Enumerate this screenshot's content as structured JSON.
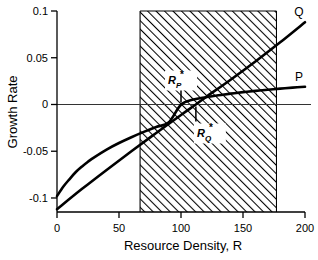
{
  "chart_data": {
    "type": "line",
    "title": "",
    "xlabel": "Resource Density, R",
    "ylabel": "Growth Rate",
    "xlim": [
      0,
      200
    ],
    "ylim": [
      -0.115,
      0.1
    ],
    "grid": false,
    "legend_position": "inline-right-of-curve-ends",
    "xticks": [
      0,
      50,
      100,
      150,
      200
    ],
    "xtick_labels": [
      "0",
      "50",
      "100",
      "150",
      "200"
    ],
    "yticks": [
      0.1,
      0.05,
      0,
      -0.05,
      -0.1
    ],
    "ytick_labels": [
      "0.1",
      "0.05",
      "0",
      "-0.05",
      "-0.1"
    ],
    "zero_reference_line": 0,
    "series": [
      {
        "name": "P",
        "label": "P",
        "style": "saturating-monod-curve",
        "x": [
          0,
          5,
          10,
          15,
          20,
          25,
          30,
          40,
          50,
          60,
          70,
          80,
          90,
          100,
          110,
          120,
          130,
          140,
          150,
          160,
          170,
          180,
          190,
          200
        ],
        "values": [
          -0.098,
          -0.088,
          -0.08,
          -0.0725,
          -0.0665,
          -0.0612,
          -0.0565,
          -0.0482,
          -0.0412,
          -0.035,
          -0.0293,
          -0.024,
          -0.0192,
          -0.0003,
          0.0053,
          0.0078,
          0.0098,
          0.0116,
          0.0132,
          0.0146,
          0.0158,
          0.017,
          0.018,
          0.019
        ],
        "zero_crossing": 100
      },
      {
        "name": "Q",
        "label": "Q",
        "style": "near-linear-line",
        "x": [
          0,
          20,
          40,
          60,
          80,
          100,
          112,
          120,
          140,
          160,
          180,
          200
        ],
        "values": [
          -0.112,
          -0.0905,
          -0.07,
          -0.05,
          -0.0305,
          -0.0112,
          0.0,
          0.0078,
          0.0265,
          0.046,
          0.0665,
          0.088
        ],
        "zero_crossing": 112
      }
    ],
    "shaded_region": {
      "label": "hatched-band",
      "x_start": 67,
      "x_end": 177,
      "pattern": "diagonal-hatch-45",
      "spans_full_height": true
    },
    "annotations": [
      {
        "name": "R-star-P",
        "text_main": "R",
        "text_sub": "P",
        "text_star": "*",
        "x": 100,
        "y": 0,
        "placement": "above-axis",
        "leader": true
      },
      {
        "name": "R-star-Q",
        "text_main": "R",
        "text_sub": "Q",
        "text_star": "*",
        "x": 112,
        "y": 0,
        "placement": "below-axis",
        "leader": true
      }
    ]
  },
  "colors": {
    "curve": "#000000",
    "axis": "#000000",
    "zero_line": "#333333",
    "hatch": "#000000",
    "background": "#ffffff"
  }
}
